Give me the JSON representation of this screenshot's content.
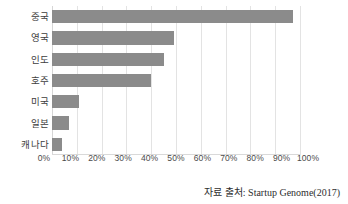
{
  "chart_data": {
    "type": "bar",
    "orientation": "horizontal",
    "title": "",
    "xlabel": "",
    "ylabel": "",
    "categories": [
      "중국",
      "영국",
      "인도",
      "호주",
      "미국",
      "일본",
      "캐나다"
    ],
    "values": [
      97,
      49,
      45,
      40,
      11,
      7,
      4
    ],
    "series": [
      {
        "name": "",
        "values": [
          97,
          49,
          45,
          40,
          11,
          7,
          4
        ]
      }
    ],
    "xlim": [
      0,
      100
    ],
    "xticks": [
      0,
      10,
      20,
      30,
      40,
      50,
      60,
      70,
      80,
      90,
      100
    ],
    "xtick_labels": [
      "0%",
      "10%",
      "20%",
      "30%",
      "40%",
      "50%",
      "60%",
      "70%",
      "80%",
      "90%",
      "100%"
    ],
    "grid": "vertical",
    "legend": "none",
    "bar_color": "#8b8b8b",
    "gridline_color": "#e3e3e3",
    "background_color": "#ffffff"
  },
  "source": {
    "text": "자료 출처: Startup Genome(2017)"
  }
}
